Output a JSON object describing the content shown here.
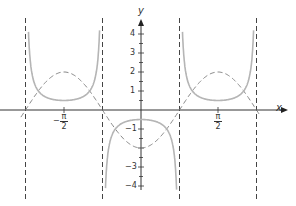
{
  "chart_data": {
    "type": "line",
    "title": "",
    "xlabel": "x",
    "ylabel": "y",
    "xlim": [
      -2.8,
      2.5
    ],
    "ylim": [
      -4.2,
      4.6
    ],
    "x_ticks": [
      "−π/2",
      "π/2"
    ],
    "y_ticks": [
      4,
      3,
      2,
      1,
      -1,
      -3,
      -4
    ],
    "grid": false,
    "legend": null,
    "series": [
      {
        "name": "y = −2cos(2x)",
        "style": "dashed",
        "color": "#888888",
        "points": [
          [
            -2.356,
            0
          ],
          [
            -1.571,
            2
          ],
          [
            -0.785,
            0
          ],
          [
            0,
            -2
          ],
          [
            0.785,
            0
          ],
          [
            1.571,
            2
          ],
          [
            2.356,
            0
          ]
        ]
      },
      {
        "name": "y = −½ sec(2x)",
        "style": "solid",
        "color": "#b0b0b0",
        "points": [
          [
            -1.571,
            0.5
          ],
          [
            0,
            -0.5
          ],
          [
            1.571,
            0.5
          ]
        ]
      }
    ],
    "asymptotes": [
      "x = −3π/4",
      "x = −π/4",
      "x = π/4",
      "x = 3π/4"
    ]
  },
  "labels": {
    "x_axis": "x",
    "y_axis": "y",
    "tick_pi_num": "π",
    "tick_pi_den": "2",
    "tick_neg": "−",
    "y4": "4",
    "y3": "3",
    "y2": "2",
    "y1": "1",
    "yn1": "−1",
    "yn3": "−3",
    "yn4": "−4"
  }
}
